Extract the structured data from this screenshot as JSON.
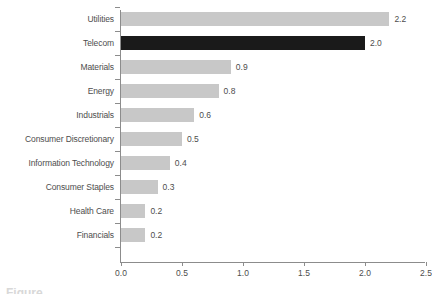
{
  "chart_data": {
    "type": "bar",
    "orientation": "horizontal",
    "title": "",
    "xlabel": "",
    "ylabel": "",
    "xlim": [
      0.0,
      2.5
    ],
    "xticks": [
      "0.0",
      "0.5",
      "1.0",
      "1.5",
      "2.0",
      "2.5"
    ],
    "xtick_values": [
      0.0,
      0.5,
      1.0,
      1.5,
      2.0,
      2.5
    ],
    "grid": false,
    "legend": null,
    "categories": [
      "Utilities",
      "Telecom",
      "Materials",
      "Energy",
      "Industrials",
      "Consumer Discretionary",
      "Information Technology",
      "Consumer Staples",
      "Health Care",
      "Financials"
    ],
    "values": [
      2.2,
      2.0,
      0.9,
      0.8,
      0.6,
      0.5,
      0.4,
      0.3,
      0.2,
      0.2
    ],
    "value_labels": [
      "2.2",
      "2.0",
      "0.9",
      "0.8",
      "0.6",
      "0.5",
      "0.4",
      "0.3",
      "0.2",
      "0.2"
    ],
    "highlighted_category": "Telecom",
    "colors": {
      "bar": "#c8c8c8",
      "bar_highlight": "#1a1a1a",
      "axis": "#8c8c8c",
      "text": "#4d4d4d",
      "background": "#ffffff"
    }
  },
  "bars": [
    {
      "label": "Utilities",
      "value": 2.2,
      "value_label": "2.2",
      "highlight": false
    },
    {
      "label": "Telecom",
      "value": 2.0,
      "value_label": "2.0",
      "highlight": true
    },
    {
      "label": "Materials",
      "value": 0.9,
      "value_label": "0.9",
      "highlight": false
    },
    {
      "label": "Energy",
      "value": 0.8,
      "value_label": "0.8",
      "highlight": false
    },
    {
      "label": "Industrials",
      "value": 0.6,
      "value_label": "0.6",
      "highlight": false
    },
    {
      "label": "Consumer Discretionary",
      "value": 0.5,
      "value_label": "0.5",
      "highlight": false
    },
    {
      "label": "Information Technology",
      "value": 0.4,
      "value_label": "0.4",
      "highlight": false
    },
    {
      "label": "Consumer Staples",
      "value": 0.3,
      "value_label": "0.3",
      "highlight": false
    },
    {
      "label": "Health Care",
      "value": 0.2,
      "value_label": "0.2",
      "highlight": false
    },
    {
      "label": "Financials",
      "value": 0.2,
      "value_label": "0.2",
      "highlight": false
    }
  ],
  "axis": {
    "ticks": [
      "0.0",
      "0.5",
      "1.0",
      "1.5",
      "2.0",
      "2.5"
    ]
  }
}
